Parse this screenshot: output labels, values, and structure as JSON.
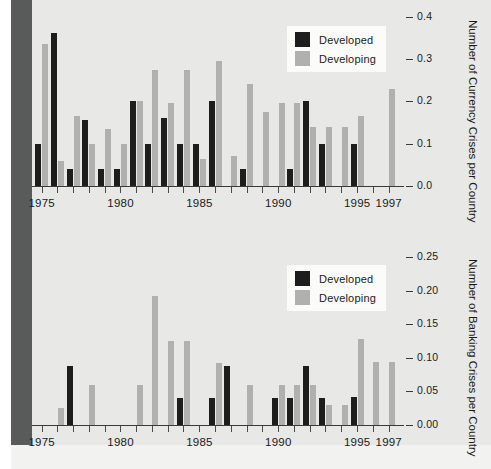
{
  "figure": {
    "background_color": "#e8e8e6",
    "left_strip_color": "#595b5a",
    "developed_color": "#1d1d1d",
    "developing_color": "#b0b0ae"
  },
  "legend": {
    "developed_label": "Developed",
    "developing_label": "Developing"
  },
  "chart_data": [
    {
      "type": "bar",
      "title": "",
      "subtitle": "",
      "ylabel": "Number of Currency Crises per Country",
      "xlabel": "",
      "ylim": [
        0.0,
        0.42
      ],
      "yticks": [
        0.0,
        0.1,
        0.2,
        0.3,
        0.4
      ],
      "ytick_labels": [
        "0.0",
        "0.1",
        "0.2",
        "0.3",
        "0.4"
      ],
      "xlim": [
        1974.4,
        1997.6
      ],
      "xticks": [
        1975,
        1976,
        1977,
        1978,
        1979,
        1980,
        1981,
        1982,
        1983,
        1984,
        1985,
        1986,
        1987,
        1988,
        1989,
        1990,
        1991,
        1992,
        1993,
        1994,
        1995,
        1996,
        1997
      ],
      "xtick_labels_shown": [
        "1975",
        "1980",
        "1985",
        "1990",
        "1995",
        "1997"
      ],
      "grid": false,
      "legend_position": "top-right",
      "categories": [
        1975,
        1976,
        1977,
        1978,
        1979,
        1980,
        1981,
        1982,
        1983,
        1984,
        1985,
        1986,
        1987,
        1988,
        1989,
        1990,
        1991,
        1992,
        1993,
        1994,
        1995,
        1996,
        1997
      ],
      "series": [
        {
          "name": "Developed",
          "color": "#1d1d1d",
          "values": [
            0.1,
            0.36,
            0.04,
            0.155,
            0.04,
            0.04,
            0.2,
            0.1,
            0.16,
            0.1,
            0.1,
            0.2,
            0.0,
            0.04,
            0.0,
            0.0,
            0.04,
            0.2,
            0.1,
            0.0,
            0.1,
            0.0,
            0.0
          ]
        },
        {
          "name": "Developing",
          "color": "#b0b0ae",
          "values": [
            0.335,
            0.06,
            0.165,
            0.1,
            0.135,
            0.1,
            0.2,
            0.275,
            0.195,
            0.275,
            0.065,
            0.295,
            0.07,
            0.24,
            0.175,
            0.195,
            0.195,
            0.14,
            0.14,
            0.14,
            0.165,
            0.0,
            0.23
          ]
        }
      ]
    },
    {
      "type": "bar",
      "title": "",
      "subtitle": "",
      "ylabel": "Number of Banking Crises per Country",
      "xlabel": "",
      "ylim": [
        0.0,
        0.265
      ],
      "yticks": [
        0.0,
        0.05,
        0.1,
        0.15,
        0.2,
        0.25
      ],
      "ytick_labels": [
        "0.00",
        "0.05",
        "0.10",
        "0.15",
        "0.20",
        "0.25"
      ],
      "xlim": [
        1974.4,
        1997.6
      ],
      "xticks": [
        1975,
        1976,
        1977,
        1978,
        1979,
        1980,
        1981,
        1982,
        1983,
        1984,
        1985,
        1986,
        1987,
        1988,
        1989,
        1990,
        1991,
        1992,
        1993,
        1994,
        1995,
        1996,
        1997
      ],
      "xtick_labels_shown": [
        "1975",
        "1980",
        "1985",
        "1990",
        "1995",
        "1997"
      ],
      "grid": false,
      "legend_position": "top-right",
      "categories": [
        1975,
        1976,
        1977,
        1978,
        1979,
        1980,
        1981,
        1982,
        1983,
        1984,
        1985,
        1986,
        1987,
        1988,
        1989,
        1990,
        1991,
        1992,
        1993,
        1994,
        1995,
        1996,
        1997
      ],
      "series": [
        {
          "name": "Developed",
          "color": "#1d1d1d",
          "values": [
            0.0,
            0.0,
            0.088,
            0.0,
            0.0,
            0.0,
            0.0,
            0.0,
            0.0,
            0.04,
            0.0,
            0.04,
            0.088,
            0.0,
            0.0,
            0.04,
            0.04,
            0.088,
            0.04,
            0.0,
            0.042,
            0.0,
            0.0
          ]
        },
        {
          "name": "Developing",
          "color": "#b0b0ae",
          "values": [
            0.0,
            0.025,
            0.0,
            0.06,
            0.0,
            0.0,
            0.06,
            0.192,
            0.125,
            0.125,
            0.0,
            0.092,
            0.0,
            0.06,
            0.0,
            0.06,
            0.06,
            0.06,
            0.03,
            0.03,
            0.128,
            0.094,
            0.094
          ]
        }
      ]
    }
  ],
  "x_axis_labels": [
    {
      "text": "1975",
      "year": 1975
    },
    {
      "text": "1980",
      "year": 1980
    },
    {
      "text": "1985",
      "year": 1985
    },
    {
      "text": "1990",
      "year": 1990
    },
    {
      "text": "1995",
      "year": 1995
    },
    {
      "text": "1997",
      "year": 1997
    }
  ]
}
